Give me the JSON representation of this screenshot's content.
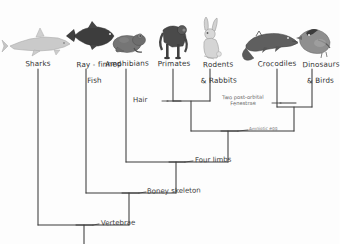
{
  "diagram": {
    "style": "hand-drawn pencil sketch",
    "ink_color": "#3a3a3a",
    "background_color": "#fdfdfd"
  },
  "taxa": [
    {
      "id": "sharks",
      "label": "Sharks",
      "label_lines": [
        "Sharks"
      ],
      "x": 38,
      "icon": "shark-icon",
      "icon_fill": "#b9b9b9"
    },
    {
      "id": "rayfinned",
      "label": "Ray-finned Fish",
      "label_lines": [
        "Ray - finned",
        "Fish"
      ],
      "x": 86,
      "icon": "tuna-fish-icon",
      "icon_fill": "#4a4a4a"
    },
    {
      "id": "amphibians",
      "label": "Amphibians",
      "label_lines": [
        "Amphibians"
      ],
      "x": 126,
      "icon": "frog-icon",
      "icon_fill": "#787878"
    },
    {
      "id": "primates",
      "label": "Primates",
      "label_lines": [
        "Primates"
      ],
      "x": 173,
      "icon": "ape-icon",
      "icon_fill": "#555555"
    },
    {
      "id": "rodents",
      "label": "Rodents & Rabbits",
      "label_lines": [
        "Rodents",
        "& Rabbits"
      ],
      "x": 210,
      "icon": "rabbit-icon",
      "icon_fill": "#c9c9c9"
    },
    {
      "id": "crocodiles",
      "label": "Crocodiles",
      "label_lines": [
        "Crocodiles"
      ],
      "x": 277,
      "icon": "crocodile-icon",
      "icon_fill": "#6d6d6d"
    },
    {
      "id": "dinosaurs",
      "label": "Dinosaurs & Birds",
      "label_lines": [
        "Dinosaurs",
        "& Birds"
      ],
      "x": 312,
      "icon": "bird-icon",
      "icon_fill": "#8a8a8a"
    }
  ],
  "traits": [
    {
      "id": "hair",
      "label": "Hair",
      "size": "big",
      "x": 148,
      "y": 101,
      "tick_x": 174,
      "tick_y": 101
    },
    {
      "id": "fenestrae",
      "label": "Two post-orbital\nFenestrae",
      "size": "small",
      "x": 228,
      "y": 98,
      "tick_x": 286,
      "tick_y": 103
    },
    {
      "id": "amniotic",
      "label": "Amniotic egg",
      "size": "tiny",
      "x": 250,
      "y": 129,
      "tick_x": 228,
      "tick_y": 131
    },
    {
      "id": "fourlimbs",
      "label": "Four limbs",
      "size": "big",
      "x": 196,
      "y": 159,
      "tick_x": 176,
      "tick_y": 162
    },
    {
      "id": "boney",
      "label": "Boney skeleton",
      "size": "big",
      "x": 148,
      "y": 190,
      "tick_x": 129,
      "tick_y": 193
    },
    {
      "id": "vertebrae",
      "label": "Vertebrae",
      "size": "big",
      "x": 100,
      "y": 223,
      "tick_x": 84,
      "tick_y": 225
    }
  ],
  "nodes": [
    {
      "id": "mammals",
      "label": "Mammals node",
      "x": 191,
      "y": 101,
      "children_x": [
        173,
        210
      ]
    },
    {
      "id": "archosaurs",
      "label": "Archosaurs node",
      "x": 294,
      "y": 107,
      "children_x": [
        277,
        312
      ]
    },
    {
      "id": "diapsids",
      "label": "Diapsid node",
      "x": 228,
      "y": 131,
      "children_x": [
        191,
        294
      ]
    },
    {
      "id": "tetrapods",
      "label": "Tetrapods node",
      "x": 176,
      "y": 162,
      "children_x": [
        126,
        228
      ]
    },
    {
      "id": "bonyfish",
      "label": "Bony vertebrates",
      "x": 129,
      "y": 193,
      "children_x": [
        86,
        176
      ]
    },
    {
      "id": "vertebrates",
      "label": "Vertebrates root",
      "x": 84,
      "y": 225,
      "children_x": [
        38,
        129
      ]
    }
  ]
}
